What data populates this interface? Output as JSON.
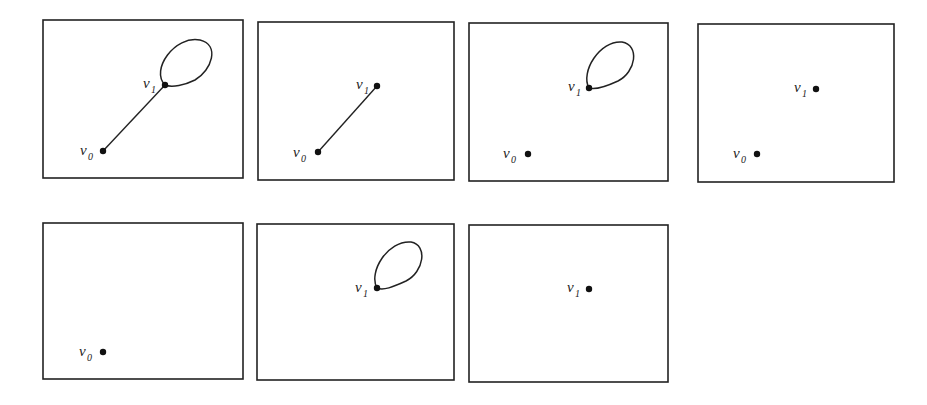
{
  "figure": {
    "panels": [
      {
        "id": 1,
        "box": [
          43,
          20,
          200,
          158
        ],
        "vertices": [
          {
            "name": "v0",
            "label": "v",
            "sub": "0",
            "x": 103,
            "y": 151,
            "lx": 80,
            "ly": 155
          },
          {
            "name": "v1",
            "label": "v",
            "sub": "1",
            "x": 165,
            "y": 85,
            "lx": 143,
            "ly": 88
          }
        ],
        "edges": [
          {
            "from": "v0",
            "to": "v1"
          }
        ],
        "loops": [
          {
            "at": "v1",
            "d": "M165,85 C150,70 175,35 200,40 C220,45 212,70 195,80 C185,85 172,88 165,85 Z"
          }
        ]
      },
      {
        "id": 2,
        "box": [
          258,
          22,
          196,
          158
        ],
        "vertices": [
          {
            "name": "v0",
            "label": "v",
            "sub": "0",
            "x": 318,
            "y": 152,
            "lx": 293,
            "ly": 157
          },
          {
            "name": "v1",
            "label": "v",
            "sub": "1",
            "x": 377,
            "y": 86,
            "lx": 356,
            "ly": 89
          }
        ],
        "edges": [
          {
            "from": "v0",
            "to": "v1"
          }
        ],
        "loops": []
      },
      {
        "id": 3,
        "box": [
          469,
          23,
          199,
          158
        ],
        "vertices": [
          {
            "name": "v0",
            "label": "v",
            "sub": "0",
            "x": 528,
            "y": 154,
            "lx": 503,
            "ly": 158
          },
          {
            "name": "v1",
            "label": "v",
            "sub": "1",
            "x": 589,
            "y": 88,
            "lx": 568,
            "ly": 91
          }
        ],
        "edges": [],
        "loops": [
          {
            "at": "v1",
            "d": "M589,88 C580,72 600,40 622,42 C640,45 636,72 618,81 C605,87 595,90 589,88 Z"
          }
        ]
      },
      {
        "id": 4,
        "box": [
          698,
          24,
          196,
          158
        ],
        "vertices": [
          {
            "name": "v0",
            "label": "v",
            "sub": "0",
            "x": 757,
            "y": 154,
            "lx": 733,
            "ly": 158
          },
          {
            "name": "v1",
            "label": "v",
            "sub": "1",
            "x": 816,
            "y": 89,
            "lx": 794,
            "ly": 92
          }
        ],
        "edges": [],
        "loops": []
      },
      {
        "id": 5,
        "box": [
          43,
          223,
          200,
          156
        ],
        "vertices": [
          {
            "name": "v0",
            "label": "v",
            "sub": "0",
            "x": 103,
            "y": 352,
            "lx": 79,
            "ly": 356
          }
        ],
        "edges": [],
        "loops": []
      },
      {
        "id": 6,
        "box": [
          257,
          224,
          197,
          156
        ],
        "vertices": [
          {
            "name": "v1",
            "label": "v",
            "sub": "1",
            "x": 377,
            "y": 288,
            "lx": 355,
            "ly": 292
          }
        ],
        "edges": [],
        "loops": [
          {
            "at": "v1",
            "d": "M377,288 C368,272 388,240 411,242 C428,245 424,272 406,281 C393,287 383,291 377,288 Z"
          }
        ]
      },
      {
        "id": 7,
        "box": [
          469,
          225,
          199,
          157
        ],
        "vertices": [
          {
            "name": "v1",
            "label": "v",
            "sub": "1",
            "x": 589,
            "y": 289,
            "lx": 567,
            "ly": 292
          }
        ],
        "edges": [],
        "loops": []
      }
    ]
  },
  "colors": {
    "ink": "#222222",
    "background": "#ffffff"
  }
}
